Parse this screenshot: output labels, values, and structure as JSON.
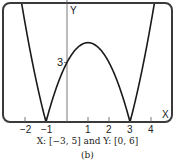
{
  "chart_data": {
    "type": "line",
    "title": "",
    "function": "y = |x^2 - 2x - 3|",
    "xlabel": "X",
    "ylabel": "Y",
    "xlim": [
      -3,
      5
    ],
    "ylim": [
      0,
      6
    ],
    "x_ticks": [
      -2,
      -1,
      1,
      2,
      3,
      4
    ],
    "x_tick_labels": [
      "−2",
      "−1",
      "1",
      "2",
      "3",
      "4"
    ],
    "y_tick_labels": [
      {
        "value": 3,
        "label": "3"
      }
    ],
    "grid": false,
    "series": [
      {
        "name": "y = |x^2 - 2x - 3|",
        "x": [
          -3,
          -2.5,
          -2,
          -1.5,
          -1,
          -0.5,
          0,
          0.5,
          1,
          1.5,
          2,
          2.5,
          3,
          3.5,
          4,
          4.5,
          5
        ],
        "y": [
          12,
          8.25,
          5,
          2.25,
          0,
          1.75,
          3,
          3.75,
          4,
          3.75,
          3,
          1.75,
          0,
          2.25,
          5,
          8.25,
          12
        ]
      }
    ],
    "annotations": [
      "3"
    ]
  },
  "caption": {
    "window": "X: [−3, 5] and Y: [0, 6]",
    "label": "(b)"
  },
  "axis": {
    "x_label": "X",
    "y_label": "Y",
    "y_mark": "3"
  },
  "colors": {
    "curve": "#1a1a1a",
    "frame": "#3a3a3a",
    "axis": "#555555"
  }
}
